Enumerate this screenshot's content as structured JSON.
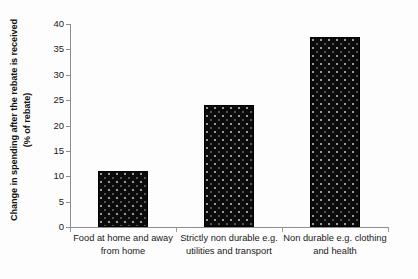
{
  "chart_data": {
    "type": "bar",
    "title": "",
    "subtitle": "",
    "xlabel": "",
    "ylabel": "Change in spending after the rebate is received (% of rebate)",
    "categories": [
      "Food at home and away from home",
      "Strictly non durable e.g. utilities and transport",
      "Non durable e.g. clothing and health"
    ],
    "values": [
      11,
      24,
      37.5
    ],
    "ylim": [
      0,
      40
    ],
    "yticks": [
      0,
      5,
      10,
      15,
      20,
      25,
      30,
      35,
      40
    ],
    "ytick_labels": [
      "0",
      "5",
      "10",
      "15",
      "20",
      "25",
      "30",
      "35",
      "40"
    ],
    "grid": false,
    "legend": null,
    "series": [
      {
        "name": "Change in spending",
        "values": [
          11,
          24,
          37.5
        ],
        "color": "#0b0b0b",
        "fill_pattern": "dotted-stipple"
      }
    ]
  },
  "colors": {
    "bar_fill": "#0b0b0b",
    "axis": "#8d8d8d",
    "text": "#1a1a1a",
    "background": "#fdfdfd"
  }
}
